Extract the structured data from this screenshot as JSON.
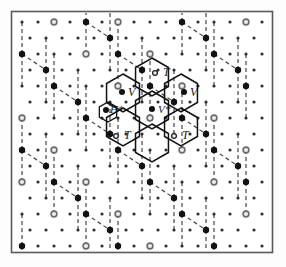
{
  "figure": {
    "frame": {
      "x": 11,
      "y": 11,
      "width": 262,
      "height": 242,
      "stroke": "#555555",
      "fill": "#ffffff"
    },
    "background": "#fdfdfd"
  },
  "colors": {
    "ink": "#1a1a1a",
    "frame": "#5a5a5a",
    "dot_small": "#2b2b2b",
    "dot_large": "#111111",
    "dot_ring": "#6b6b6b",
    "solid_line": "#111111",
    "dashed_line": "#333333"
  },
  "lattice": {
    "description": "triangular point lattice of substrate atoms",
    "spacing_x": 16,
    "spacing_y": 16,
    "row_offset_x": 8,
    "origin": {
      "x": 22,
      "y": 22
    },
    "cols": 16,
    "rows": 15,
    "site_types": [
      {
        "name": "small-dot",
        "radius": 1.5,
        "fill": "#2b2b2b",
        "role": "substrate-atom"
      },
      {
        "name": "large-dot",
        "radius": 3.2,
        "fill": "#111111",
        "role": "honeycomb-vertex"
      },
      {
        "name": "ring-dot",
        "radius": 3.0,
        "fill": "#e8e8e8",
        "stroke": "#6b6b6b",
        "role": "center-site"
      }
    ]
  },
  "chart_data": {
    "type": "scatter",
    "xlabel": "",
    "ylabel": "",
    "legend_position": "none",
    "grid": false,
    "series": [
      {
        "name": "substrate atoms (small dots)",
        "marker": "small-filled-circle",
        "count": 160
      },
      {
        "name": "honeycomb vertices (large dots)",
        "marker": "large-filled-circle",
        "count": 26
      },
      {
        "name": "hollow centres (ring dots)",
        "marker": "open-circle",
        "count": 20
      }
    ],
    "annotations": [
      {
        "label": "T",
        "x": 163,
        "y": 75,
        "site": "top"
      },
      {
        "label": "T",
        "x": 122,
        "y": 137,
        "site": "top"
      },
      {
        "label": "T",
        "x": 180,
        "y": 137,
        "site": "top"
      },
      {
        "label": "V",
        "x": 129,
        "y": 94,
        "site": "vacancy"
      },
      {
        "label": "V",
        "x": 190,
        "y": 94,
        "site": "vacancy"
      },
      {
        "label": "V*",
        "x": 160,
        "y": 111,
        "site": "vacancy-star"
      },
      {
        "label": "H*",
        "x": 113,
        "y": 112,
        "site": "hollow-star"
      }
    ]
  },
  "labels": [
    {
      "id": "t-top",
      "text": "T",
      "x": 163,
      "y": 76,
      "dot": {
        "x": 155,
        "y": 73
      }
    },
    {
      "id": "t-lower-left",
      "text": "T",
      "x": 124,
      "y": 139,
      "dot": {
        "x": 116,
        "y": 136
      }
    },
    {
      "id": "t-lower-right",
      "text": "T",
      "x": 182,
      "y": 139,
      "dot": {
        "x": 174,
        "y": 136
      }
    },
    {
      "id": "v-left",
      "text": "V",
      "x": 128,
      "y": 96,
      "dot": {
        "x": 122,
        "y": 92
      }
    },
    {
      "id": "v-right",
      "text": "V",
      "x": 190,
      "y": 96,
      "dot": {
        "x": 184,
        "y": 92
      }
    },
    {
      "id": "v-star",
      "text": "V*",
      "x": 158,
      "y": 113,
      "dot": {
        "x": 152,
        "y": 109
      }
    },
    {
      "id": "h-star",
      "text": "H*",
      "x": 110,
      "y": 113,
      "dot": {
        "x": 106,
        "y": 110
      }
    }
  ],
  "rosette": {
    "description": "seven solid-line hexagons in flower arrangement",
    "hex_radius": 19,
    "orientation": "pointy-top",
    "centers": [
      {
        "id": "center",
        "x": 152,
        "y": 110
      },
      {
        "id": "upper",
        "x": 152,
        "y": 77
      },
      {
        "id": "upper-left",
        "x": 123,
        "y": 93
      },
      {
        "id": "upper-right",
        "x": 181,
        "y": 93
      },
      {
        "id": "lower-left",
        "x": 123,
        "y": 127
      },
      {
        "id": "lower-right",
        "x": 181,
        "y": 127
      },
      {
        "id": "lower",
        "x": 152,
        "y": 143
      }
    ],
    "small_hex": {
      "id": "h-star-cell",
      "x": 108,
      "y": 112,
      "radius": 10
    }
  },
  "honeycomb": {
    "description": "dashed honeycomb network over large dots",
    "stroke_dash": "4 3",
    "edge_length": 33
  }
}
